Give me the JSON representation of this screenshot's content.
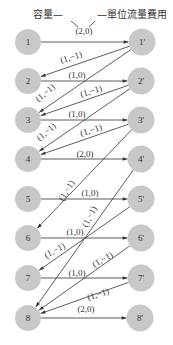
{
  "header": {
    "capacity_label": "容量—",
    "cost_label": "—單位流量費用"
  },
  "colors": {
    "node_fill": "#c8c8c8",
    "line": "#333333",
    "text": "#333333",
    "background": "#ffffff"
  },
  "nodes": {
    "left": [
      {
        "id": "1",
        "label": "1",
        "x": 28,
        "y": 42
      },
      {
        "id": "2",
        "label": "2",
        "x": 28,
        "y": 81
      },
      {
        "id": "3",
        "label": "3",
        "x": 28,
        "y": 120
      },
      {
        "id": "4",
        "label": "4",
        "x": 28,
        "y": 159
      },
      {
        "id": "5",
        "label": "5",
        "x": 28,
        "y": 199
      },
      {
        "id": "6",
        "label": "6",
        "x": 28,
        "y": 238
      },
      {
        "id": "7",
        "label": "7",
        "x": 28,
        "y": 278
      },
      {
        "id": "8",
        "label": "8",
        "x": 28,
        "y": 318
      }
    ],
    "right": [
      {
        "id": "1p",
        "label": "1'",
        "x": 142,
        "y": 42
      },
      {
        "id": "2p",
        "label": "2'",
        "x": 141,
        "y": 81
      },
      {
        "id": "3p",
        "label": "3'",
        "x": 141,
        "y": 120
      },
      {
        "id": "4p",
        "label": "4'",
        "x": 141,
        "y": 159
      },
      {
        "id": "5p",
        "label": "5'",
        "x": 141,
        "y": 199
      },
      {
        "id": "6p",
        "label": "6'",
        "x": 141,
        "y": 238
      },
      {
        "id": "7p",
        "label": "7'",
        "x": 141,
        "y": 278
      },
      {
        "id": "8p",
        "label": "8'",
        "x": 140,
        "y": 318
      }
    ]
  },
  "edges": [
    {
      "from": "1",
      "to": "1p",
      "label": "(2,0)",
      "lx": 84,
      "ly": 34,
      "rot": 0
    },
    {
      "from": "1p",
      "to": "2",
      "label": "(1,−1)",
      "lx": 72,
      "ly": 60,
      "rot": -17
    },
    {
      "from": "1p",
      "to": "3",
      "label": "(1,−1)",
      "lx": 47,
      "ly": 95,
      "rot": -40
    },
    {
      "from": "2",
      "to": "2p",
      "label": "(1,0)",
      "lx": 77,
      "ly": 78,
      "rot": 0
    },
    {
      "from": "2p",
      "to": "3",
      "label": "(1,−1)",
      "lx": 92,
      "ly": 94,
      "rot": -17
    },
    {
      "from": "2p",
      "to": "4",
      "label": "(1,−1)",
      "lx": 48,
      "ly": 134,
      "rot": -40
    },
    {
      "from": "3",
      "to": "3p",
      "label": "(1,0)",
      "lx": 77,
      "ly": 117,
      "rot": 0
    },
    {
      "from": "3p",
      "to": "4",
      "label": "(1,−1)",
      "lx": 92,
      "ly": 133,
      "rot": -17
    },
    {
      "from": "4",
      "to": "4p",
      "label": "(2,0)",
      "lx": 85,
      "ly": 157,
      "rot": 0
    },
    {
      "from": "3p",
      "to": "6",
      "label": "(1,−1)",
      "lx": 69,
      "ly": 192,
      "rot": -58
    },
    {
      "from": "5",
      "to": "5p",
      "label": "(1,0)",
      "lx": 90,
      "ly": 196,
      "rot": 0
    },
    {
      "from": "4p",
      "to": "8",
      "label": "(1,−1)",
      "lx": 92,
      "ly": 218,
      "rot": -62
    },
    {
      "from": "6",
      "to": "6p",
      "label": "(1,0)",
      "lx": 75,
      "ly": 235,
      "rot": 0
    },
    {
      "from": "5p",
      "to": "7",
      "label": "(1,−1)",
      "lx": 56,
      "ly": 253,
      "rot": -28
    },
    {
      "from": "6p",
      "to": "8",
      "label": "(1,−1)",
      "lx": 104,
      "ly": 262,
      "rot": -30
    },
    {
      "from": "7",
      "to": "7p",
      "label": "(1,0)",
      "lx": 77,
      "ly": 276,
      "rot": 0
    },
    {
      "from": "7p",
      "to": "8",
      "label": "(1,−1)",
      "lx": 99,
      "ly": 297,
      "rot": -17
    },
    {
      "from": "8",
      "to": "8p",
      "label": "(2,0)",
      "lx": 86,
      "ly": 312,
      "rot": 0
    }
  ]
}
